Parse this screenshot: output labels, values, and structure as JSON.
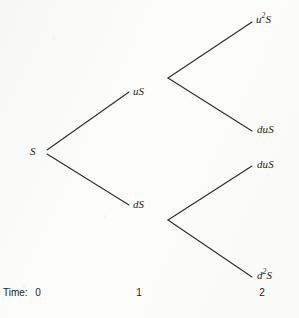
{
  "figure": {
    "type": "binomial-tree",
    "background_color": "#fdfdfc",
    "line_color": "#2b2b2b"
  },
  "nodes": [
    {
      "id": "root",
      "label_html": "S",
      "plain": "S",
      "x": 30,
      "y": 146,
      "step": 0
    },
    {
      "id": "up1",
      "label_html": "uS",
      "plain": "uS",
      "x": 133,
      "y": 86,
      "step": 1
    },
    {
      "id": "down1",
      "label_html": "dS",
      "plain": "dS",
      "x": 133,
      "y": 199,
      "step": 1
    },
    {
      "id": "uu",
      "label_html": "u<sup>2</sup>S",
      "plain": "u2S",
      "x": 256,
      "y": 14,
      "step": 2
    },
    {
      "id": "ud",
      "label_html": "duS",
      "plain": "duS",
      "x": 257,
      "y": 124,
      "step": 2
    },
    {
      "id": "du",
      "label_html": "duS",
      "plain": "duS",
      "x": 257,
      "y": 159,
      "step": 2
    },
    {
      "id": "dd",
      "label_html": "d<sup>2</sup>S",
      "plain": "d2S",
      "x": 257,
      "y": 270,
      "step": 2
    }
  ],
  "edges": [
    {
      "from": "root",
      "to": "up1",
      "x1": 47,
      "y1": 150,
      "x2": 129,
      "y2": 92
    },
    {
      "from": "root",
      "to": "down1",
      "x1": 47,
      "y1": 154,
      "x2": 129,
      "y2": 205
    },
    {
      "from": "up1",
      "to": "uu",
      "x1": 168,
      "y1": 78,
      "x2": 252,
      "y2": 22
    },
    {
      "from": "up1",
      "to": "ud",
      "x1": 168,
      "y1": 78,
      "x2": 252,
      "y2": 131
    },
    {
      "from": "down1",
      "to": "du",
      "x1": 168,
      "y1": 220,
      "x2": 252,
      "y2": 166
    },
    {
      "from": "down1",
      "to": "dd",
      "x1": 168,
      "y1": 220,
      "x2": 252,
      "y2": 277
    }
  ],
  "time_axis": {
    "caption": "Time:",
    "ticks": [
      {
        "label": "0",
        "x": 38
      },
      {
        "label": "1",
        "x": 139
      },
      {
        "label": "2",
        "x": 262
      }
    ]
  }
}
